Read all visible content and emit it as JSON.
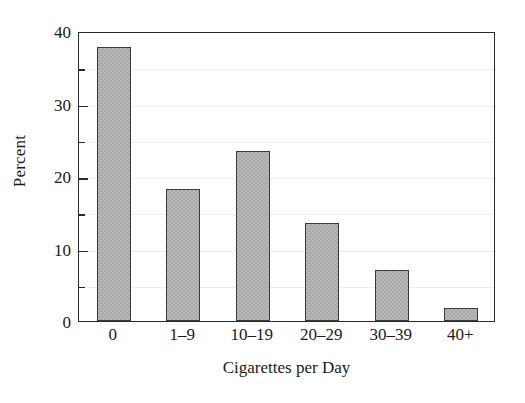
{
  "chart_data": {
    "type": "bar",
    "title": "",
    "xlabel": "Cigarettes per Day",
    "ylabel": "Percent",
    "categories": [
      "0",
      "1–9",
      "10–19",
      "20–29",
      "30–39",
      "40+"
    ],
    "values": [
      37.8,
      18.2,
      23.5,
      13.5,
      7.1,
      1.8
    ],
    "ylim": [
      0,
      40
    ],
    "y_major_ticks": [
      0,
      10,
      20,
      30,
      40
    ],
    "y_major_tick_labels": [
      "0",
      "10",
      "20",
      "30",
      "40"
    ],
    "y_minor_ticks": [
      5,
      15,
      25,
      35
    ],
    "grid": true,
    "grid_axis": "y",
    "grid_color": "#ededed",
    "legend": null,
    "bar_color": "#a9a9a9",
    "bar_edge_color": "#3a3a3a",
    "axis_color": "#2b2b2b",
    "background_color": "#ffffff"
  }
}
